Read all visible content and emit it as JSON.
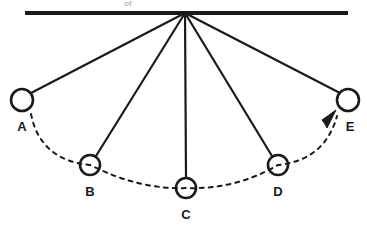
{
  "diagram": {
    "background_color": "#ffffff",
    "stroke_color": "#1a1a1a",
    "support": {
      "name": "horizontal support bar",
      "x1": 25,
      "x2": 348,
      "y": 13,
      "thickness": 4
    },
    "pivot": {
      "name": "pivot point",
      "x": 185,
      "y": 13
    },
    "bobs": [
      {
        "label": "A",
        "cx": 22,
        "cy": 100,
        "r": 11,
        "label_x": 22,
        "label_y": 131
      },
      {
        "label": "B",
        "cx": 90,
        "cy": 165,
        "r": 10,
        "label_x": 90,
        "label_y": 196
      },
      {
        "label": "C",
        "cx": 186,
        "cy": 188,
        "r": 10,
        "label_x": 186,
        "label_y": 219
      },
      {
        "label": "D",
        "cx": 278,
        "cy": 165,
        "r": 10,
        "label_x": 278,
        "label_y": 196
      },
      {
        "label": "E",
        "cx": 348,
        "cy": 100,
        "r": 11,
        "label_x": 350,
        "label_y": 131
      }
    ],
    "strings": [
      {
        "name": "string-to-A",
        "x1": 185,
        "y1": 13,
        "x2": 31,
        "y2": 93
      },
      {
        "name": "string-to-B",
        "x1": 185,
        "y1": 13,
        "x2": 96,
        "y2": 156
      },
      {
        "name": "string-to-C",
        "x1": 185,
        "y1": 13,
        "x2": 186,
        "y2": 178
      },
      {
        "name": "string-to-D",
        "x1": 185,
        "y1": 13,
        "x2": 272,
        "y2": 156
      },
      {
        "name": "string-to-E",
        "x1": 185,
        "y1": 13,
        "x2": 340,
        "y2": 93
      }
    ],
    "arc": {
      "name": "swing path arc",
      "style": "dashed",
      "path": "M 31 114 Q 40 160 90 165 Q 140 190 186 188 Q 235 190 278 165 Q 325 160 337 116"
    },
    "direction_arrow": {
      "name": "direction of swing arrow",
      "points": "322,120 336,110 327,128 325,124",
      "pointing": "toward E (up and to the right)"
    },
    "top_artifact_text": "of"
  }
}
